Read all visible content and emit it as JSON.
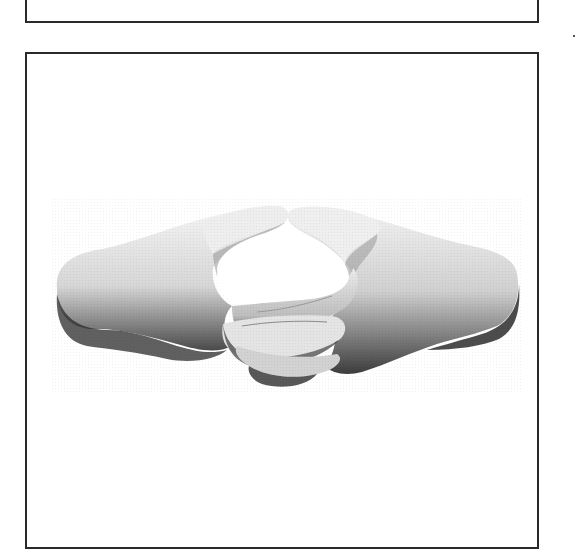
{
  "page": {
    "type": "scanned document page",
    "background": "#ffffff",
    "border_color": "#2a2a2a"
  },
  "frames": [
    {
      "id": "top-frame",
      "content": ""
    },
    {
      "id": "main-frame",
      "figure": {
        "subject": "two hands touching at fingertips in a steeple gesture",
        "style": "grayscale halftone photograph",
        "alt": "Two hands with fingertips touching, forming a steeple"
      }
    }
  ],
  "marks": {
    "stray_dot": "·"
  }
}
